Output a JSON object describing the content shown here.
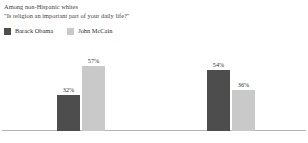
{
  "header": {
    "line1": "Among non-Hispanic whites",
    "line2": "\"Is religion an important part of your daily life?\""
  },
  "legend": {
    "position": "top-left",
    "entries": [
      {
        "label": "Barack Obama",
        "color": "#4d4d4d"
      },
      {
        "label": "John McCain",
        "color": "#c9c9c9"
      }
    ]
  },
  "colors": {
    "obama": "#4d4d4d",
    "mccain": "#c9c9c9",
    "axis": "#b4b4b4",
    "text": "#2f2f2f",
    "background": "#ffffff"
  },
  "chart_data": {
    "type": "bar",
    "title": "Among non-Hispanic whites",
    "subtitle": "\"Is religion an important part of your daily life?\"",
    "xlabel": "",
    "ylabel": "",
    "ylim": [
      0,
      80
    ],
    "grid": false,
    "legend_position": "top-left",
    "categories": [
      "Yes",
      "No"
    ],
    "series": [
      {
        "name": "Barack Obama",
        "color": "#4d4d4d",
        "values": [
          32,
          54
        ],
        "labels": [
          "32%",
          "57%"
        ]
      },
      {
        "name": "John McCain",
        "color": "#c9c9c9",
        "values": [
          57,
          36
        ],
        "labels": [
          "54%",
          "36%"
        ]
      }
    ],
    "groups": [
      {
        "category": "Yes",
        "bars": [
          {
            "series": "Barack Obama",
            "value": 32,
            "label": "32%",
            "color": "#4d4d4d"
          },
          {
            "series": "John McCain",
            "value": 57,
            "label": "57%",
            "color": "#c9c9c9"
          }
        ]
      },
      {
        "category": "No",
        "bars": [
          {
            "series": "Barack Obama",
            "value": 54,
            "label": "54%",
            "color": "#4d4d4d"
          },
          {
            "series": "John McCain",
            "value": 36,
            "label": "36%",
            "color": "#c9c9c9"
          }
        ]
      }
    ]
  }
}
